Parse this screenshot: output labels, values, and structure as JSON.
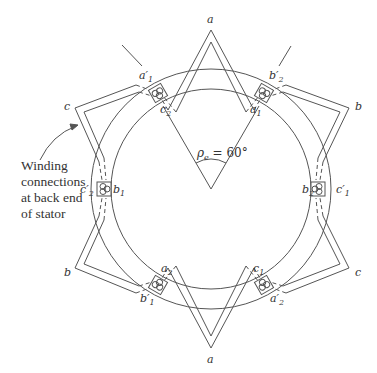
{
  "diagram": {
    "center": {
      "x": 211,
      "y": 189
    },
    "stator": {
      "outer_radius": 120,
      "inner_radius": 100,
      "slot_radius": 110
    },
    "angle_label": {
      "symbol": "ρ",
      "subscript": "e",
      "text": " = 60°"
    },
    "callout": {
      "lines": [
        "Winding",
        "connections",
        "at back end",
        "of stator"
      ]
    },
    "star_points": [
      {
        "label": "a",
        "angle": 90
      },
      {
        "label": "b",
        "angle": 30
      },
      {
        "label": "c",
        "angle": -30
      },
      {
        "label": "a",
        "angle": -90
      },
      {
        "label": "b",
        "angle": -150
      },
      {
        "label": "c",
        "angle": 150
      }
    ],
    "slots": [
      {
        "inner_label": "c",
        "inner_sub": "2",
        "outer_label": "a′",
        "outer_sub": "1",
        "angle": 120
      },
      {
        "inner_label": "a",
        "inner_sub": "1",
        "outer_label": "b′",
        "outer_sub": "2",
        "angle": 60
      },
      {
        "inner_label": "b",
        "inner_sub": "2",
        "outer_label": "c′",
        "outer_sub": "1",
        "angle": 0
      },
      {
        "inner_label": "c",
        "inner_sub": "1",
        "outer_label": "a′",
        "outer_sub": "2",
        "angle": -60
      },
      {
        "inner_label": "a",
        "inner_sub": "2",
        "outer_label": "b′",
        "outer_sub": "1",
        "angle": -120
      },
      {
        "inner_label": "b",
        "inner_sub": "1",
        "outer_label": "c′",
        "outer_sub": "2",
        "angle": 180
      }
    ]
  }
}
